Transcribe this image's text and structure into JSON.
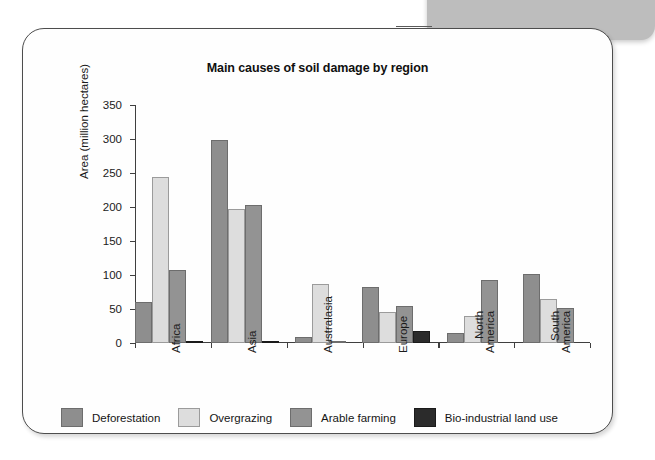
{
  "figure": {
    "title": "Main causes of soil damage by region"
  },
  "chart_data": {
    "type": "bar",
    "title": "Main causes of soil damage by region",
    "xlabel": "",
    "ylabel": "Area (million hectares)",
    "ylim": [
      0,
      350
    ],
    "yticks": [
      0,
      50,
      100,
      150,
      200,
      250,
      300,
      350
    ],
    "ytick_labels": [
      "0",
      "50",
      "100",
      "150",
      "200",
      "250",
      "300",
      "350"
    ],
    "grid": false,
    "legend_position": "below-plot",
    "categories": [
      "Africa",
      "Asia",
      "Australasia",
      "Europe",
      "North\nAmerica",
      "South\nAmerica"
    ],
    "series": [
      {
        "name": "Deforestation",
        "color": "#8e8e8e",
        "values": [
          60,
          298,
          9,
          82,
          15,
          102
        ]
      },
      {
        "name": "Overgrazing",
        "color": "#dddddd",
        "values": [
          244,
          197,
          87,
          45,
          40,
          64
        ]
      },
      {
        "name": "Arable farming",
        "color": "#939393",
        "values": [
          107,
          203,
          3,
          54,
          92,
          51
        ]
      },
      {
        "name": "Bio-industrial land use",
        "color": "#2b2b2b",
        "values": [
          3,
          2,
          0,
          18,
          0,
          0
        ]
      }
    ]
  }
}
